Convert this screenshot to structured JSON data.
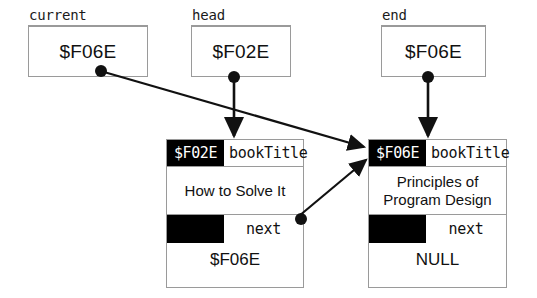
{
  "diagram": {
    "type": "pointer-diagram",
    "colors": {
      "background": "#ffffff",
      "line": "#9a9a9a",
      "arrow": "#111111",
      "address_cell_bg": "#000000",
      "address_cell_text": "#ffffff",
      "text": "#111111"
    }
  },
  "variables": [
    {
      "name": "current",
      "value": "$F06E",
      "points_to": "$F06E"
    },
    {
      "name": "head",
      "value": "$F02E",
      "points_to": "$F02E"
    },
    {
      "name": "end",
      "value": "$F06E",
      "points_to": "$F06E"
    }
  ],
  "nodes": [
    {
      "address": "$F02E",
      "field_title_name": "bookTitle",
      "field_title_value": "How  to Solve It",
      "field_next_name": "next",
      "field_next_value": "$F06E",
      "next_address_cell": ""
    },
    {
      "address": "$F06E",
      "field_title_name": "bookTitle",
      "field_title_value": "Principles of\nProgram Design",
      "field_next_name": "next",
      "field_next_value": "NULL",
      "next_address_cell": ""
    }
  ],
  "arrows": [
    {
      "from": "current",
      "to": "node-$F06E",
      "style": "diagonal-long"
    },
    {
      "from": "head",
      "to": "node-$F02E",
      "style": "vertical"
    },
    {
      "from": "end",
      "to": "node-$F06E",
      "style": "vertical"
    },
    {
      "from": "node-$F02E.next",
      "to": "node-$F06E",
      "style": "diagonal-short"
    }
  ]
}
